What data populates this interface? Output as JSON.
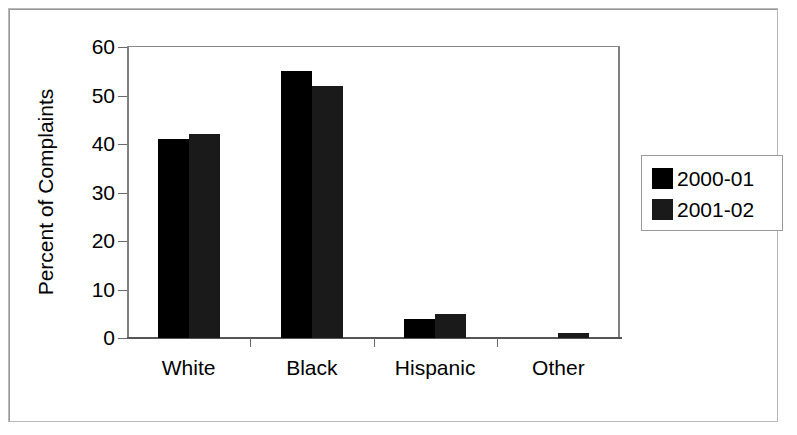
{
  "chart_data": {
    "type": "bar",
    "title": "",
    "xlabel": "",
    "ylabel": "Percent of Complaints",
    "categories": [
      "White",
      "Black",
      "Hispanic",
      "Other"
    ],
    "series": [
      {
        "name": "2000-01",
        "color": "#000000",
        "values": [
          41,
          55,
          4,
          0
        ]
      },
      {
        "name": "2001-02",
        "color": "#1a1a1a",
        "values": [
          42,
          52,
          5,
          1
        ]
      }
    ],
    "ylim": [
      0,
      60
    ],
    "yticks": [
      0,
      10,
      20,
      30,
      40,
      50,
      60
    ],
    "ytick_labels": [
      "0",
      "10",
      "20",
      "30",
      "40",
      "50",
      "60"
    ],
    "grid": true,
    "legend_position": "right-outside"
  },
  "legend": {
    "entries": [
      {
        "label": "2000-01"
      },
      {
        "label": "2001-02"
      }
    ]
  },
  "axis": {
    "y_title": "Percent of Complaints"
  }
}
